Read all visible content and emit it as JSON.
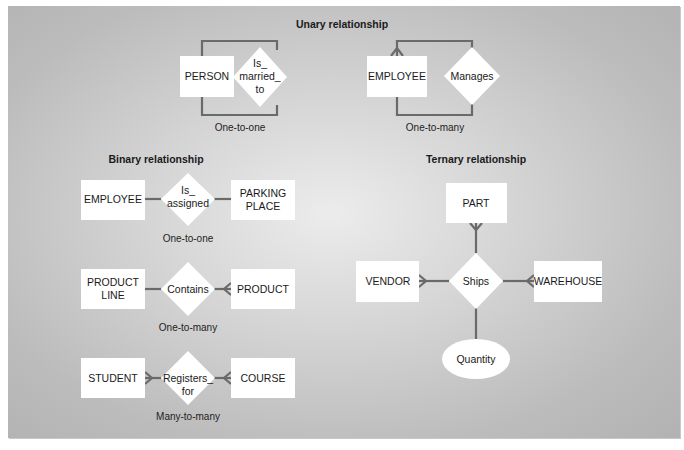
{
  "colors": {
    "background": "#c4c4c4",
    "entity_fill": "#ffffff",
    "line": "#6a6a6a",
    "text": "#1a1a1a"
  },
  "sections": {
    "unary": {
      "title": "Unary relationship",
      "examples": [
        {
          "entity": "PERSON",
          "relationship": [
            "Is_",
            "married_",
            "to"
          ],
          "cardinality": "One-to-one"
        },
        {
          "entity": "EMPLOYEE",
          "relationship": [
            "Manages"
          ],
          "cardinality": "One-to-many"
        }
      ]
    },
    "binary": {
      "title": "Binary relationship",
      "examples": [
        {
          "left": [
            "EMPLOYEE"
          ],
          "relationship": [
            "Is_",
            "assigned"
          ],
          "right": [
            "PARKING",
            "PLACE"
          ],
          "cardinality": "One-to-one"
        },
        {
          "left": [
            "PRODUCT",
            "LINE"
          ],
          "relationship": [
            "Contains"
          ],
          "right": [
            "PRODUCT"
          ],
          "cardinality": "One-to-many"
        },
        {
          "left": [
            "STUDENT"
          ],
          "relationship": [
            "Registers_",
            "for"
          ],
          "right": [
            "COURSE"
          ],
          "cardinality": "Many-to-many"
        }
      ]
    },
    "ternary": {
      "title": "Ternary relationship",
      "top": "PART",
      "left": "VENDOR",
      "right": "WAREHOUSE",
      "relationship": "Ships",
      "attribute": "Quantity"
    }
  }
}
